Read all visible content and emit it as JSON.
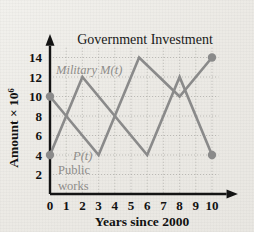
{
  "chart_data": {
    "type": "line",
    "title": "Government Investment",
    "xlabel": "Years since 2000",
    "ylabel": "Amount × 10⁶",
    "ylabel_base": "Amount × 10",
    "ylabel_exp": "6",
    "xlim": [
      0,
      10.6
    ],
    "ylim": [
      0,
      15
    ],
    "xticks": [
      0,
      1,
      2,
      3,
      4,
      5,
      6,
      7,
      8,
      9,
      10
    ],
    "yticks": [
      2,
      4,
      6,
      8,
      10,
      12,
      14
    ],
    "grid": true,
    "legend_position": "inline-annotation",
    "series": [
      {
        "name": "M(t)",
        "label": "Military M(t)",
        "label_math": "Military M(t)",
        "color": "#8a8a8a",
        "points": [
          {
            "x": 0,
            "y": 10
          },
          {
            "x": 3,
            "y": 4
          },
          {
            "x": 5.5,
            "y": 14
          },
          {
            "x": 8,
            "y": 10
          },
          {
            "x": 10,
            "y": 14
          }
        ],
        "endpoint_markers": [
          {
            "x": 0,
            "y": 10
          },
          {
            "x": 10,
            "y": 14
          }
        ]
      },
      {
        "name": "P(t)",
        "label": "P(t) Public works",
        "label_line1": "P(t)",
        "label_line2": "Public",
        "label_line3": "works",
        "color": "#8a8a8a",
        "points": [
          {
            "x": 0,
            "y": 4
          },
          {
            "x": 2,
            "y": 12
          },
          {
            "x": 6,
            "y": 4
          },
          {
            "x": 8,
            "y": 12
          },
          {
            "x": 10,
            "y": 4
          }
        ],
        "endpoint_markers": [
          {
            "x": 0,
            "y": 4
          },
          {
            "x": 10,
            "y": 4
          }
        ]
      }
    ]
  },
  "annotations": {
    "military_label": "Military M(t)",
    "public_p": "P(t)",
    "public_word1": "Public",
    "public_word2": "works"
  }
}
